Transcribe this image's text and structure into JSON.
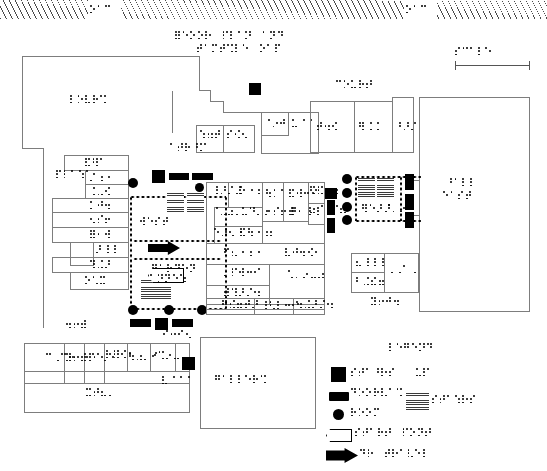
{
  "document": {
    "kind": "tactile-braille-floor-plan",
    "title_braille_lines": [
      "⠿⠑⠕⠕⠗ ⠏⠇⠁⠝ ⠁⠝⠙",
      "⠞⠁⠍⠞⠩⠇⠑ ⠕⠁⠏"
    ],
    "ink_color": "#000000",
    "outline_color": "#7d7d7d",
    "page_background": "#ffffff"
  },
  "street_band": {
    "name": "hatched street band",
    "labels": [
      "⠕⠁⠉",
      "⠕⠁⠉"
    ],
    "hatch_color": "#4a4a4a"
  },
  "scale": {
    "label_braille": "⠎⠉⠁⠇⠑",
    "bar_present": true
  },
  "legend": {
    "heading_braille": "⠇⠑⠛⠑⠝⠙",
    "entries": [
      {
        "symbol": "filled-square",
        "label_braille": "⠎⠞⠁⠘⠗⠎  ⠥⠏",
        "color": "#000000"
      },
      {
        "symbol": "filled-bar",
        "label_braille": "⠙⠕⠕⠗⠧⠁⠩",
        "color": "#000000"
      },
      {
        "symbol": "filled-circle",
        "label_braille": "⠗⠕⠕⠍",
        "color": "#000000"
      },
      {
        "symbol": "outline-arrow",
        "label_braille": "⠎⠞⠁⠗⠞ ⠏⠕⠝⠞",
        "color": "#ffffff"
      },
      {
        "symbol": "solid-arrow",
        "label_braille": "⠙⠗ ⠞⠗⠁⠧⠑⠇",
        "color": "#000000"
      }
    ],
    "extra_symbols": [
      {
        "symbol": "stair-hatch",
        "label_braille": "⠎⠞⠁⠱⠗⠎"
      }
    ]
  },
  "map_labels": [
    {
      "id": "lbl-lobby",
      "braille": "⠇⠕⠧⠗⠩"
    },
    {
      "id": "lbl-court-a",
      "braille": "⠉⠕⠥⠗⠞"
    },
    {
      "id": "lbl-hall-north",
      "braille": "⠘⠁⠇⠇"
    },
    {
      "id": "lbl-wing-east",
      "braille": "⠑⠁⠎⠞"
    },
    {
      "id": "lbl-wing-west",
      "braille": "⠺⠑⠎⠞"
    },
    {
      "id": "lbl-garden",
      "braille": "⠛⠁⠗⠙⠑⠝"
    },
    {
      "id": "lbl-annex",
      "braille": "⠁⠝⠝⠑⠱"
    },
    {
      "id": "lbl-gallery",
      "braille": "⠛⠁⠇⠇⠑⠗⠩"
    },
    {
      "id": "lbl-atrium",
      "braille": "⠁⠞⠗⠘⠍"
    },
    {
      "id": "lbl-plaza",
      "braille": "⠏⠇⠁⠱⠁"
    }
  ],
  "rooms": [
    {
      "id": "r1",
      "label_braille": "⠁▁▁"
    },
    {
      "id": "r2",
      "label_braille": "⠃▁▁"
    },
    {
      "id": "r3",
      "label_braille": "⠉▁▁"
    }
  ]
}
